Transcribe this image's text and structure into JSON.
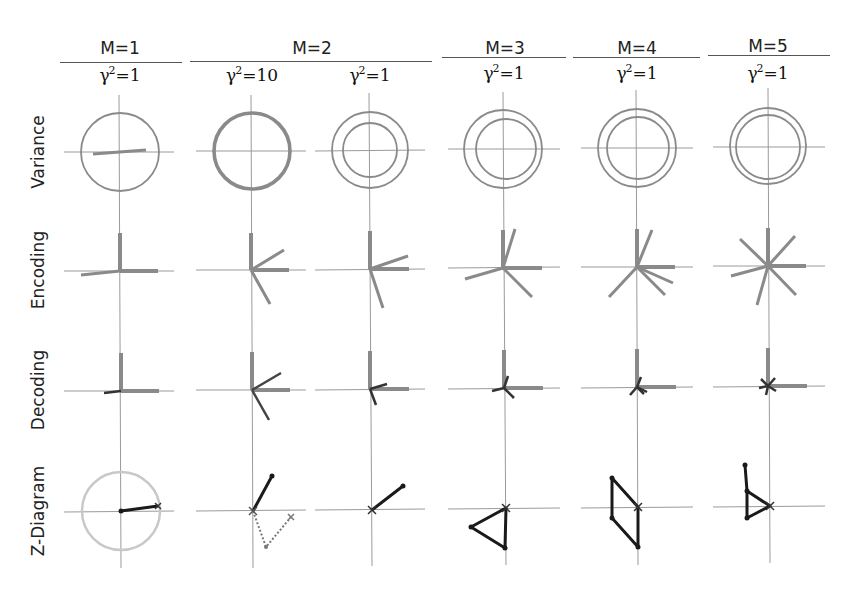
{
  "figure": {
    "groups": [
      {
        "label": "M=1",
        "center": 120,
        "rule": [
          60,
          182
        ]
      },
      {
        "label": "M=2",
        "center": 312,
        "rule": [
          190,
          432
        ]
      },
      {
        "label": "M=3",
        "center": 505,
        "rule": [
          442,
          566
        ]
      },
      {
        "label": "M=4",
        "center": 637,
        "rule": [
          573,
          700
        ]
      },
      {
        "label": "M=5",
        "center": 768,
        "rule": [
          708,
          830
        ]
      }
    ],
    "columns": [
      {
        "gamma_base": "γ",
        "gamma_exp": "2",
        "gamma_value": "=1",
        "cx": 120
      },
      {
        "gamma_base": "γ",
        "gamma_exp": "2",
        "gamma_value": "=10",
        "cx": 252
      },
      {
        "gamma_base": "γ",
        "gamma_exp": "2",
        "gamma_value": "=1",
        "cx": 370
      },
      {
        "gamma_base": "γ",
        "gamma_exp": "2",
        "gamma_value": "=1",
        "cx": 504
      },
      {
        "gamma_base": "γ",
        "gamma_exp": "2",
        "gamma_value": "=1",
        "cx": 637
      },
      {
        "gamma_base": "γ",
        "gamma_exp": "2",
        "gamma_value": "=1",
        "cx": 768
      }
    ],
    "rows": [
      {
        "label": "Variance",
        "cy": 152
      },
      {
        "label": "Encoding",
        "cy": 270
      },
      {
        "label": "Decoding",
        "cy": 390
      },
      {
        "label": "Z-Diagram",
        "cy": 511
      }
    ],
    "colors": {
      "axis": "#9a9a9a",
      "gray_stroke": "#8a8a8a",
      "dark_stroke": "#1a1a1a",
      "light_circle": "#c8c8c8",
      "text": "#222222"
    }
  }
}
